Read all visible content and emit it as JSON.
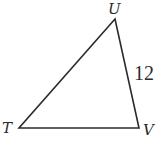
{
  "figure": {
    "type": "triangle",
    "vertices": [
      {
        "name": "U",
        "x": 115,
        "y": 19,
        "label_x": 108,
        "label_y": 14
      },
      {
        "name": "T",
        "x": 19,
        "y": 128,
        "label_x": 2,
        "label_y": 133
      },
      {
        "name": "V",
        "x": 139,
        "y": 128,
        "label_x": 143,
        "label_y": 135
      }
    ],
    "side_labels": [
      {
        "side": "UV",
        "text": "12",
        "x": 134,
        "y": 80
      }
    ],
    "stroke_color": "#2b2b2b"
  }
}
